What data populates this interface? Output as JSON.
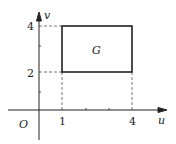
{
  "diagram": {
    "type": "coordinate-region",
    "axes": {
      "x_label": "u",
      "y_label": "v",
      "origin_label": "O"
    },
    "x_ticks": [
      {
        "value": 1,
        "label": "1"
      },
      {
        "value": 4,
        "label": "4"
      }
    ],
    "y_ticks": [
      {
        "value": 2,
        "label": "2"
      },
      {
        "value": 4,
        "label": "4"
      }
    ],
    "region": {
      "label": "G",
      "u_range": [
        1,
        4
      ],
      "v_range": [
        2,
        4
      ]
    },
    "colors": {
      "stroke": "#222222",
      "dashed": "#555555",
      "background": "#ffffff"
    }
  }
}
